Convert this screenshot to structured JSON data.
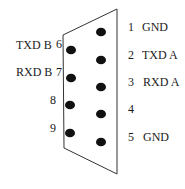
{
  "diagram": {
    "type": "connector-pinout",
    "connector": {
      "shape": "trapezoid",
      "outline_color": "#333333",
      "corners": {
        "top_left": [
          63,
          35
        ],
        "top_right": [
          117,
          9
        ],
        "bottom_right": [
          117,
          174
        ],
        "bottom_left": [
          64,
          148
        ]
      }
    },
    "pin_color": "#111111",
    "pins": [
      {
        "number": "1",
        "signal": "GND",
        "side": "right",
        "cx": 101,
        "cy": 32
      },
      {
        "number": "2",
        "signal": "TXD A",
        "side": "right",
        "cx": 101,
        "cy": 60
      },
      {
        "number": "3",
        "signal": "RXD A",
        "side": "right",
        "cx": 101,
        "cy": 87
      },
      {
        "number": "4",
        "signal": "",
        "side": "right",
        "cx": 101,
        "cy": 114
      },
      {
        "number": "5",
        "signal": "GND",
        "side": "right",
        "cx": 101,
        "cy": 142
      },
      {
        "number": "6",
        "signal": "TXD B",
        "side": "left",
        "cx": 71,
        "cy": 50
      },
      {
        "number": "7",
        "signal": "RXD B",
        "side": "left",
        "cx": 71,
        "cy": 78
      },
      {
        "number": "8",
        "signal": "",
        "side": "left",
        "cx": 70,
        "cy": 105
      },
      {
        "number": "9",
        "signal": "",
        "side": "left",
        "cx": 70,
        "cy": 133
      }
    ]
  }
}
